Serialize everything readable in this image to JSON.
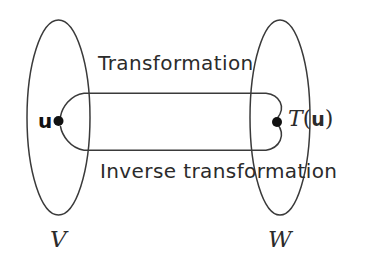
{
  "figure": {
    "kind": "set-mapping-diagram",
    "background_color": "#ffffff",
    "stroke_color": "#3a3a3a",
    "text_color": "#2b2b2b"
  },
  "sets": {
    "domain": {
      "label": "V",
      "point_label": "u",
      "point_marker": "filled-dot"
    },
    "codomain": {
      "label": "W",
      "point_label_prefix": "T",
      "point_label_open": "(",
      "point_label_arg": "u",
      "point_label_close": ")",
      "point_marker": "filled-dot"
    }
  },
  "arrows": {
    "forward": {
      "label": "Transformation"
    },
    "backward": {
      "label": "Inverse transformation"
    }
  }
}
